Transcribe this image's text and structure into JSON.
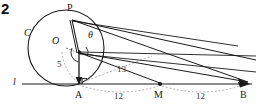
{
  "problem": {
    "number": "2"
  },
  "figure": {
    "type": "geometry-diagram",
    "colors": {
      "stroke": "#1a1a1a",
      "dotted": "#8a8a8a",
      "background": "#ffffff"
    },
    "labels": {
      "circle": "C",
      "center": "O",
      "apex": "P",
      "angle": "θ",
      "line": "l",
      "foot": "A",
      "midpoint": "M",
      "endpoint": "B"
    },
    "measures": {
      "radius": "5",
      "hypotenuse": "13",
      "segment_am": "12",
      "segment_mb": "12"
    },
    "points": {
      "P": {
        "x": 72,
        "y": 20
      },
      "O": {
        "x": 66,
        "y": 48
      },
      "V": {
        "x": 80,
        "y": 53
      },
      "A": {
        "x": 80,
        "y": 84
      },
      "M": {
        "x": 160,
        "y": 84
      },
      "B": {
        "x": 242,
        "y": 84
      }
    },
    "circle_geom": {
      "cx": 66,
      "cy": 48,
      "r": 38
    },
    "line_geom": {
      "x1": 22,
      "x2": 252,
      "y": 84
    }
  }
}
